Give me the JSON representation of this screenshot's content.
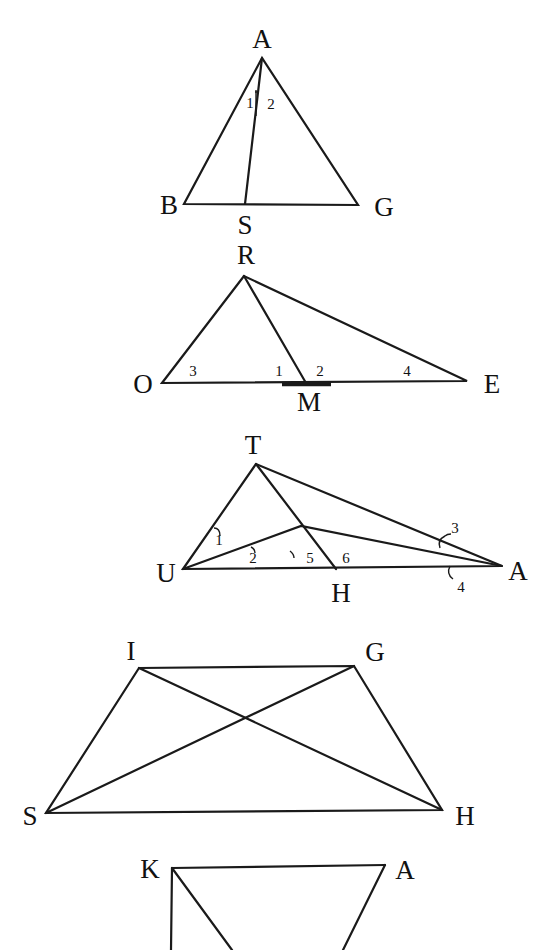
{
  "figures": [
    {
      "id": "triangle-ABG",
      "vertices": {
        "A": "A",
        "B": "B",
        "G": "G",
        "S": "S"
      },
      "angles": {
        "a1": "1",
        "a2": "2"
      }
    },
    {
      "id": "triangle-ROE",
      "vertices": {
        "R": "R",
        "O": "O",
        "E": "E",
        "M": "M"
      },
      "angles": {
        "a1": "1",
        "a2": "2",
        "a3": "3",
        "a4": "4"
      }
    },
    {
      "id": "triangle-TUA",
      "vertices": {
        "T": "T",
        "U": "U",
        "A": "A",
        "H": "H"
      },
      "angles": {
        "a1": "1",
        "a2": "2",
        "a3": "3",
        "a4": "4",
        "a5": "5",
        "a6": "6"
      }
    },
    {
      "id": "trapezoid-SIGH",
      "vertices": {
        "I": "I",
        "G": "G",
        "S": "S",
        "H": "H"
      }
    },
    {
      "id": "figure-KA",
      "vertices": {
        "K": "K",
        "A": "A"
      }
    }
  ],
  "colors": {
    "ink": "#1a1a1a",
    "paper": "#ffffff"
  }
}
